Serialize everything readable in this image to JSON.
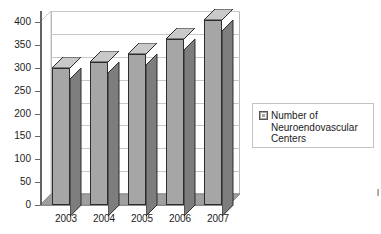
{
  "chart_data": {
    "type": "bar",
    "title": "",
    "subtitle": "",
    "xlabel": "",
    "ylabel": "",
    "categories": [
      "2003",
      "2004",
      "2005",
      "2006",
      "2007"
    ],
    "values": [
      300,
      313,
      330,
      363,
      405
    ],
    "series": [
      {
        "name": "Number of Neuroendovascular Centers",
        "values": [
          300,
          313,
          330,
          363,
          405
        ]
      }
    ],
    "ylim": [
      0,
      400
    ],
    "ytick_labels": [
      "0",
      "50",
      "100",
      "150",
      "200",
      "250",
      "300",
      "350",
      "400"
    ],
    "ytick_values": [
      0,
      50,
      100,
      150,
      200,
      250,
      300,
      350,
      400
    ],
    "grid": true,
    "grid_axis": "y",
    "legend_position": "right",
    "style": "3d-column",
    "colors": {
      "bar_face": "#a6a6a6",
      "bar_side": "#7d7d7d",
      "bar_top": "#c9c9c9",
      "bar_outline": "#2c2c2c",
      "floor": "#9f9f9f",
      "gridline": "#c8c8c8",
      "axis": "#636363",
      "plot_background": "#ffffff",
      "text": "#1b1b1b"
    }
  },
  "legend": {
    "entries": [
      {
        "label": "Number of Neuroendovascular Centers",
        "swatch": "legend-swatch-gray"
      }
    ]
  },
  "edge_text": "l"
}
